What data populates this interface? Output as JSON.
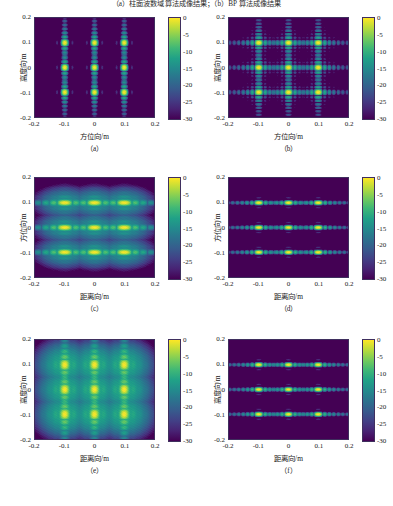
{
  "figure": {
    "top_caption": "（a）柱面波数域算法成像结果；（b）BP 算法成像结果",
    "colormap": "viridis",
    "background_color": "#2a1b4d",
    "peak_color": "#fde725"
  },
  "colorbar": {
    "ticks": [
      "0",
      "-5",
      "-10",
      "-15",
      "-20",
      "-25",
      "-30"
    ],
    "min": -30,
    "max": 0,
    "unit": "dB"
  },
  "axis_ticks": {
    "x": [
      "-0.2",
      "-0.1",
      "0",
      "0.1",
      "0.2"
    ],
    "y": [
      "0.2",
      "0.1",
      "0",
      "-0.1",
      "-0.2"
    ]
  },
  "labels": {
    "azimuth": "方位向/m",
    "height": "高度向/m",
    "range": "距离向/m"
  },
  "captions": {
    "a": "（a）",
    "b": "（b）",
    "c": "（c）",
    "d": "（d）",
    "e": "（e）",
    "f": "（f）"
  },
  "chart_data": [
    {
      "id": "a",
      "type": "heatmap",
      "title": "",
      "xlabel": "方位向/m",
      "ylabel": "高度向/m",
      "caption": "（a）",
      "xlim": [
        -0.2,
        0.2
      ],
      "ylim": [
        -0.2,
        0.2
      ],
      "zlim": [
        -30,
        0
      ],
      "zunit": "dB",
      "colormap": "viridis",
      "grid": false,
      "targets_x": [
        -0.1,
        0,
        0.1
      ],
      "targets_y": [
        -0.1,
        0,
        0.1
      ],
      "target_peak_db": 0,
      "sidelobe_axis": "vertical",
      "sidelobe_strength": 0.45,
      "main_lobe_rx": 0.018,
      "main_lobe_ry": 0.016,
      "blur": 0.0
    },
    {
      "id": "b",
      "type": "heatmap",
      "title": "",
      "xlabel": "方位向/m",
      "ylabel": "高度向/m",
      "caption": "（b）",
      "xlim": [
        -0.2,
        0.2
      ],
      "ylim": [
        -0.2,
        0.2
      ],
      "zlim": [
        -30,
        0
      ],
      "zunit": "dB",
      "colormap": "viridis",
      "grid": false,
      "targets_x": [
        -0.1,
        0,
        0.1
      ],
      "targets_y": [
        -0.1,
        0,
        0.1
      ],
      "target_peak_db": 0,
      "sidelobe_axis": "cross",
      "sidelobe_strength": 0.42,
      "main_lobe_rx": 0.015,
      "main_lobe_ry": 0.014,
      "blur": 0.0
    },
    {
      "id": "c",
      "type": "heatmap",
      "title": "",
      "xlabel": "距离向/m",
      "ylabel": "方位向/m",
      "caption": "（c）",
      "xlim": [
        -0.2,
        0.2
      ],
      "ylim": [
        -0.2,
        0.2
      ],
      "zlim": [
        -30,
        0
      ],
      "zunit": "dB",
      "colormap": "viridis",
      "grid": false,
      "targets_x": [
        -0.1,
        0,
        0.1
      ],
      "targets_y": [
        -0.1,
        0,
        0.1
      ],
      "target_peak_db": 0,
      "sidelobe_axis": "horizontal",
      "sidelobe_strength": 0.5,
      "main_lobe_rx": 0.026,
      "main_lobe_ry": 0.017,
      "blur": 0.35
    },
    {
      "id": "d",
      "type": "heatmap",
      "title": "",
      "xlabel": "距离向/m",
      "ylabel": "方位向/m",
      "caption": "（d）",
      "xlim": [
        -0.2,
        0.2
      ],
      "ylim": [
        -0.2,
        0.2
      ],
      "zlim": [
        -30,
        0
      ],
      "zunit": "dB",
      "colormap": "viridis",
      "grid": false,
      "targets_x": [
        -0.1,
        0,
        0.1
      ],
      "targets_y": [
        -0.1,
        0,
        0.1
      ],
      "target_peak_db": 0,
      "sidelobe_axis": "horizontal",
      "sidelobe_strength": 0.62,
      "main_lobe_rx": 0.016,
      "main_lobe_ry": 0.014,
      "blur": 0.0
    },
    {
      "id": "e",
      "type": "heatmap",
      "title": "",
      "xlabel": "距离向/m",
      "ylabel": "高度向/m",
      "caption": "（e）",
      "xlim": [
        -0.2,
        0.2
      ],
      "ylim": [
        -0.2,
        0.2
      ],
      "zlim": [
        -30,
        0
      ],
      "zunit": "dB",
      "colormap": "viridis",
      "grid": false,
      "targets_x": [
        -0.1,
        0,
        0.1
      ],
      "targets_y": [
        -0.1,
        0,
        0.1
      ],
      "target_peak_db": 0,
      "sidelobe_axis": "vertical",
      "sidelobe_strength": 0.55,
      "main_lobe_rx": 0.022,
      "main_lobe_ry": 0.022,
      "blur": 0.5
    },
    {
      "id": "f",
      "type": "heatmap",
      "title": "",
      "xlabel": "距离向/m",
      "ylabel": "高度向/m",
      "caption": "（f）",
      "xlim": [
        -0.2,
        0.2
      ],
      "ylim": [
        -0.2,
        0.2
      ],
      "zlim": [
        -30,
        0
      ],
      "zunit": "dB",
      "colormap": "viridis",
      "grid": false,
      "targets_x": [
        -0.1,
        0,
        0.1
      ],
      "targets_y": [
        -0.1,
        0,
        0.1
      ],
      "target_peak_db": 0,
      "sidelobe_axis": "horizontal",
      "sidelobe_strength": 0.66,
      "main_lobe_rx": 0.015,
      "main_lobe_ry": 0.014,
      "blur": 0.0
    }
  ]
}
